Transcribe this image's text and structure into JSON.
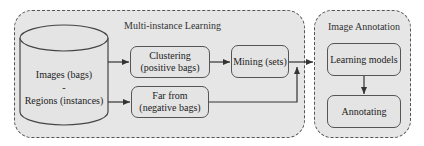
{
  "groups": {
    "mil": {
      "title": "Multi-instance Learning"
    },
    "annotation": {
      "title": "Image Annotation"
    }
  },
  "nodes": {
    "database": {
      "line1": "Images (bags)",
      "line2": "-",
      "line3": "Regions (instances)",
      "shape": "cylinder"
    },
    "clustering": {
      "line1": "Clustering",
      "line2": "(positive bags)"
    },
    "far_from": {
      "line1": "Far from",
      "line2": "(negative bags)"
    },
    "mining": {
      "line1": "Mining (sets)"
    },
    "learning_models": {
      "line1": "Learning models"
    },
    "annotating": {
      "line1": "Annotating"
    }
  },
  "edges": [
    {
      "from": "database",
      "to": "clustering"
    },
    {
      "from": "database",
      "to": "far_from"
    },
    {
      "from": "clustering",
      "to": "mining"
    },
    {
      "from": "far_from",
      "to": "mining"
    },
    {
      "from": "mining",
      "to": "learning_models"
    },
    {
      "from": "learning_models",
      "to": "annotating"
    }
  ],
  "colors": {
    "group_fill": "#e6e6e6",
    "stroke": "#555555",
    "node_fill": "#e4e4e4"
  }
}
